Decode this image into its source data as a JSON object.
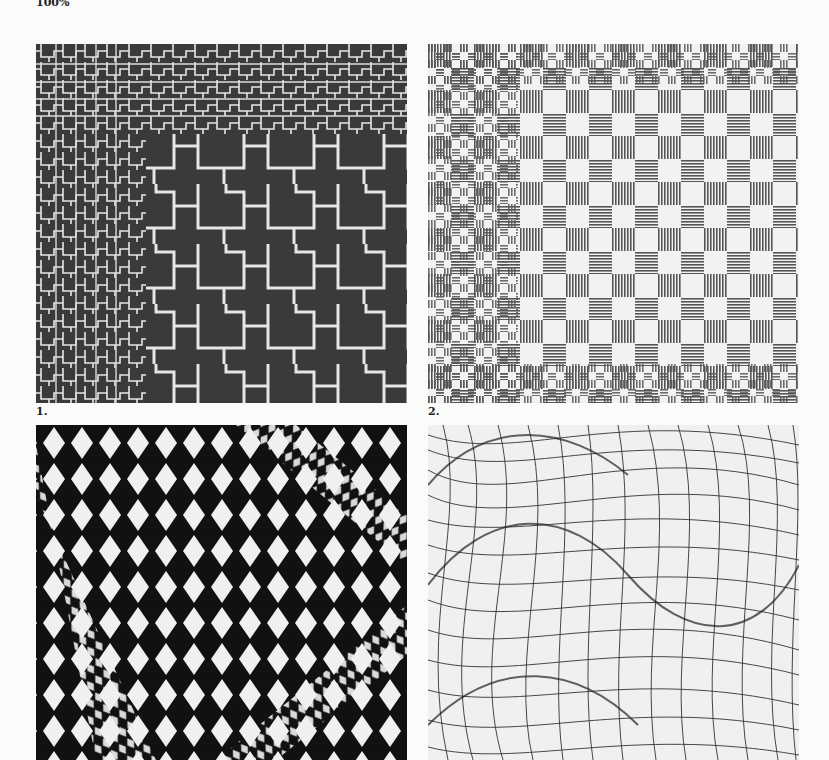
{
  "page": {
    "zoom_label": "100%"
  },
  "figures": [
    {
      "caption": "1.",
      "pattern": "stepped-cross-lines-on-dark",
      "colors": {
        "background": "#3a3a3a",
        "lines": "#e8e8e8"
      }
    },
    {
      "caption": "2.",
      "pattern": "striped-checkerboard",
      "colors": {
        "background": "#f2f2f2",
        "stripes": "#555555"
      }
    },
    {
      "caption": "",
      "pattern": "distorted-diamond-checker",
      "colors": {
        "background": "#111111",
        "diamonds": "#f0f0f0"
      }
    },
    {
      "caption": "",
      "pattern": "warped-grid-mesh",
      "colors": {
        "background": "#f0f0f0",
        "lines": "#333333"
      }
    }
  ]
}
